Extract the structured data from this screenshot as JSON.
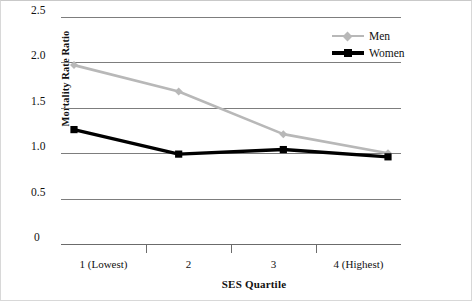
{
  "chart_data": {
    "type": "line",
    "title": "",
    "xlabel": "SES Quartile",
    "ylabel": "Mortality Rate Ratio",
    "categories": [
      "1 (Lowest)",
      "2",
      "3",
      "4 (Highest)"
    ],
    "ylim": [
      0,
      2.5
    ],
    "yticks": [
      "0",
      "0.5",
      "1.0",
      "1.5",
      "2.0",
      "2.5"
    ],
    "ytick_values": [
      0,
      0.5,
      1.0,
      1.5,
      2.0,
      2.5
    ],
    "grid": "horizontal",
    "legend_position": "top-right-inside",
    "series": [
      {
        "name": "Men",
        "color": "#b8b8b8",
        "marker": "diamond",
        "values": [
          1.97,
          1.68,
          1.21,
          1.0
        ]
      },
      {
        "name": "Women",
        "color": "#000000",
        "marker": "square",
        "values": [
          1.26,
          0.99,
          1.04,
          0.96
        ]
      }
    ]
  },
  "legend": {
    "items": [
      {
        "label": "Men"
      },
      {
        "label": "Women"
      }
    ]
  },
  "axes": {
    "y_title": "Mortality Rate Ratio",
    "x_title": "SES Quartile",
    "y_labels": [
      "2.5",
      "2.0",
      "1.5",
      "1.0",
      "0.5",
      "0"
    ],
    "x_labels": [
      "1 (Lowest)",
      "2",
      "3",
      "4 (Highest)"
    ]
  }
}
